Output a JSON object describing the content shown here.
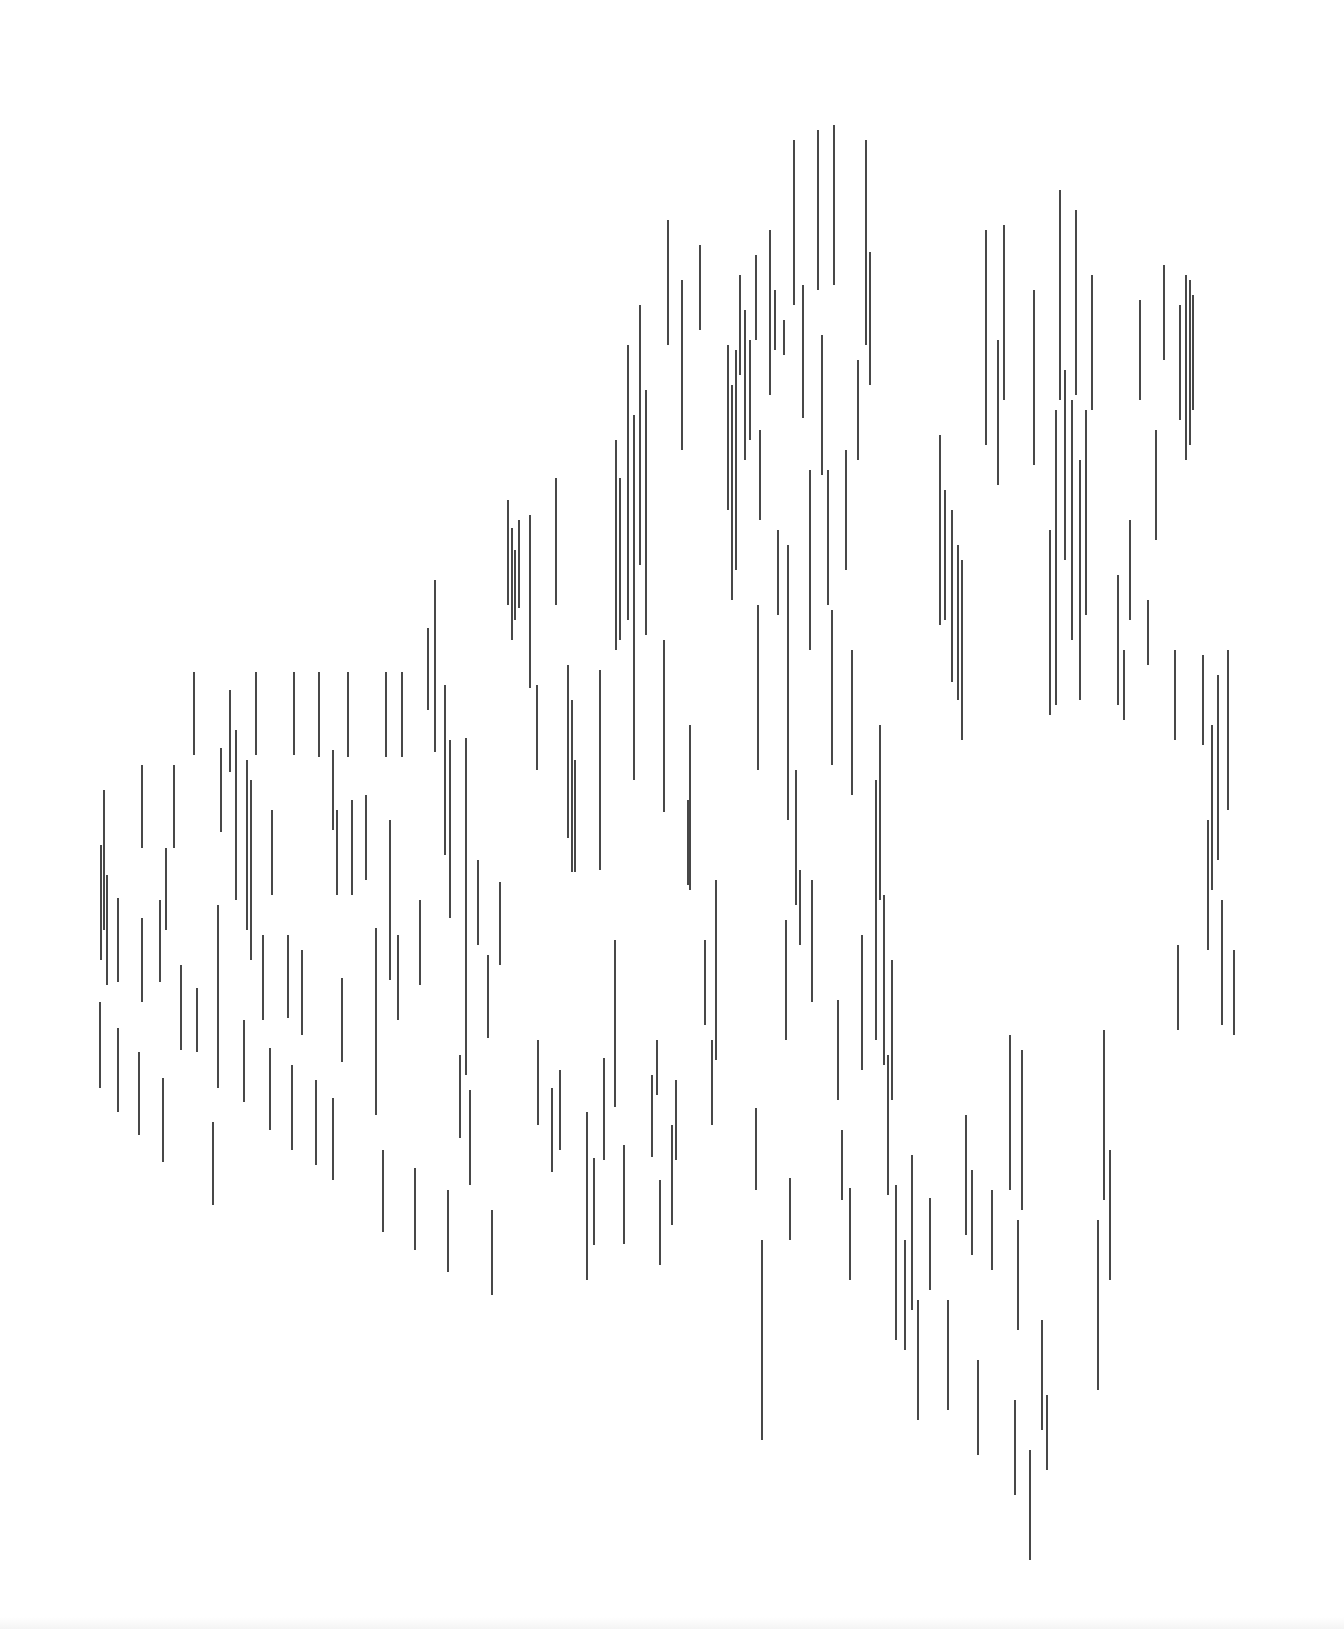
{
  "artwork": {
    "stroke_color": "#1a1a1a",
    "background": "#ffffff",
    "stroke_width": 1.6,
    "lines": [
      [
        104,
        790,
        104,
        930
      ],
      [
        101,
        845,
        101,
        960
      ],
      [
        107,
        875,
        107,
        985
      ],
      [
        100,
        1002,
        100,
        1088
      ],
      [
        118,
        898,
        118,
        982
      ],
      [
        118,
        1028,
        118,
        1112
      ],
      [
        142,
        765,
        142,
        848
      ],
      [
        142,
        918,
        142,
        1002
      ],
      [
        139,
        1052,
        139,
        1135
      ],
      [
        160,
        900,
        160,
        982
      ],
      [
        163,
        1078,
        163,
        1162
      ],
      [
        174,
        765,
        174,
        848
      ],
      [
        166,
        848,
        166,
        930
      ],
      [
        181,
        965,
        181,
        1050
      ],
      [
        194,
        672,
        194,
        755
      ],
      [
        197,
        988,
        197,
        1052
      ],
      [
        213,
        1122,
        213,
        1205
      ],
      [
        221,
        748,
        221,
        832
      ],
      [
        218,
        905,
        218,
        1088
      ],
      [
        230,
        690,
        230,
        772
      ],
      [
        236,
        730,
        236,
        900
      ],
      [
        244,
        1020,
        244,
        1102
      ],
      [
        247,
        760,
        247,
        930
      ],
      [
        256,
        672,
        256,
        755
      ],
      [
        251,
        780,
        251,
        960
      ],
      [
        263,
        935,
        263,
        1020
      ],
      [
        272,
        810,
        272,
        895
      ],
      [
        270,
        1048,
        270,
        1130
      ],
      [
        288,
        935,
        288,
        1018
      ],
      [
        294,
        672,
        294,
        755
      ],
      [
        292,
        1065,
        292,
        1150
      ],
      [
        302,
        950,
        302,
        1035
      ],
      [
        319,
        672,
        319,
        757
      ],
      [
        316,
        1080,
        316,
        1165
      ],
      [
        333,
        750,
        333,
        830
      ],
      [
        333,
        1098,
        333,
        1180
      ],
      [
        337,
        810,
        337,
        895
      ],
      [
        342,
        978,
        342,
        1062
      ],
      [
        348,
        672,
        348,
        757
      ],
      [
        352,
        800,
        352,
        895
      ],
      [
        366,
        795,
        366,
        880
      ],
      [
        376,
        928,
        376,
        1115
      ],
      [
        386,
        672,
        386,
        757
      ],
      [
        383,
        1150,
        383,
        1232
      ],
      [
        390,
        820,
        390,
        980
      ],
      [
        402,
        672,
        402,
        757
      ],
      [
        398,
        935,
        398,
        1020
      ],
      [
        415,
        1168,
        415,
        1250
      ],
      [
        420,
        900,
        420,
        985
      ],
      [
        428,
        628,
        428,
        710
      ],
      [
        435,
        580,
        435,
        752
      ],
      [
        445,
        685,
        445,
        855
      ],
      [
        448,
        1190,
        448,
        1272
      ],
      [
        450,
        740,
        450,
        918
      ],
      [
        460,
        1055,
        460,
        1138
      ],
      [
        466,
        738,
        466,
        1075
      ],
      [
        470,
        1090,
        470,
        1185
      ],
      [
        478,
        860,
        478,
        945
      ],
      [
        488,
        955,
        488,
        1038
      ],
      [
        492,
        1210,
        492,
        1295
      ],
      [
        500,
        882,
        500,
        965
      ],
      [
        508,
        500,
        508,
        605
      ],
      [
        512,
        528,
        512,
        640
      ],
      [
        515,
        550,
        515,
        620
      ],
      [
        519,
        520,
        519,
        608
      ],
      [
        530,
        515,
        530,
        688
      ],
      [
        537,
        685,
        537,
        770
      ],
      [
        538,
        1040,
        538,
        1125
      ],
      [
        552,
        1088,
        552,
        1172
      ],
      [
        556,
        478,
        556,
        605
      ],
      [
        560,
        1070,
        560,
        1150
      ],
      [
        568,
        665,
        568,
        838
      ],
      [
        572,
        700,
        572,
        872
      ],
      [
        575,
        760,
        575,
        872
      ],
      [
        587,
        1112,
        587,
        1280
      ],
      [
        594,
        1158,
        594,
        1245
      ],
      [
        600,
        670,
        600,
        870
      ],
      [
        604,
        1058,
        604,
        1160
      ],
      [
        616,
        440,
        616,
        650
      ],
      [
        615,
        940,
        615,
        1107
      ],
      [
        620,
        478,
        620,
        640
      ],
      [
        624,
        1145,
        624,
        1244
      ],
      [
        628,
        345,
        628,
        620
      ],
      [
        634,
        415,
        634,
        780
      ],
      [
        640,
        305,
        640,
        565
      ],
      [
        646,
        390,
        646,
        635
      ],
      [
        652,
        1075,
        652,
        1157
      ],
      [
        657,
        1040,
        657,
        1095
      ],
      [
        660,
        1180,
        660,
        1265
      ],
      [
        664,
        640,
        664,
        812
      ],
      [
        668,
        220,
        668,
        345
      ],
      [
        672,
        1125,
        672,
        1225
      ],
      [
        676,
        1080,
        676,
        1160
      ],
      [
        682,
        280,
        682,
        450
      ],
      [
        688,
        800,
        688,
        885
      ],
      [
        690,
        725,
        690,
        890
      ],
      [
        700,
        245,
        700,
        330
      ],
      [
        705,
        940,
        705,
        1025
      ],
      [
        712,
        1040,
        712,
        1125
      ],
      [
        716,
        880,
        716,
        1060
      ],
      [
        728,
        345,
        728,
        510
      ],
      [
        732,
        385,
        732,
        600
      ],
      [
        736,
        350,
        736,
        570
      ],
      [
        740,
        275,
        740,
        375
      ],
      [
        745,
        310,
        745,
        460
      ],
      [
        750,
        340,
        750,
        440
      ],
      [
        756,
        255,
        756,
        340
      ],
      [
        758,
        605,
        758,
        770
      ],
      [
        756,
        1108,
        756,
        1190
      ],
      [
        760,
        430,
        760,
        520
      ],
      [
        762,
        1240,
        762,
        1440
      ],
      [
        770,
        230,
        770,
        395
      ],
      [
        775,
        290,
        775,
        350
      ],
      [
        778,
        530,
        778,
        615
      ],
      [
        784,
        320,
        784,
        355
      ],
      [
        788,
        545,
        788,
        820
      ],
      [
        786,
        920,
        786,
        1040
      ],
      [
        794,
        140,
        794,
        305
      ],
      [
        790,
        1178,
        790,
        1240
      ],
      [
        796,
        770,
        796,
        905
      ],
      [
        800,
        870,
        800,
        945
      ],
      [
        803,
        285,
        803,
        418
      ],
      [
        810,
        470,
        810,
        650
      ],
      [
        812,
        880,
        812,
        1002
      ],
      [
        818,
        130,
        818,
        290
      ],
      [
        822,
        335,
        822,
        475
      ],
      [
        828,
        470,
        828,
        605
      ],
      [
        832,
        610,
        832,
        765
      ],
      [
        834,
        125,
        834,
        285
      ],
      [
        838,
        1000,
        838,
        1100
      ],
      [
        842,
        1130,
        842,
        1200
      ],
      [
        846,
        450,
        846,
        570
      ],
      [
        850,
        1188,
        850,
        1280
      ],
      [
        852,
        650,
        852,
        795
      ],
      [
        858,
        360,
        858,
        460
      ],
      [
        862,
        935,
        862,
        1070
      ],
      [
        866,
        140,
        866,
        345
      ],
      [
        870,
        252,
        870,
        385
      ],
      [
        876,
        780,
        876,
        1040
      ],
      [
        880,
        725,
        880,
        900
      ],
      [
        884,
        895,
        884,
        1065
      ],
      [
        888,
        1055,
        888,
        1195
      ],
      [
        892,
        960,
        892,
        1100
      ],
      [
        896,
        1185,
        896,
        1340
      ],
      [
        905,
        1240,
        905,
        1350
      ],
      [
        912,
        1155,
        912,
        1310
      ],
      [
        918,
        1300,
        918,
        1420
      ],
      [
        930,
        1198,
        930,
        1290
      ],
      [
        940,
        435,
        940,
        625
      ],
      [
        945,
        490,
        945,
        620
      ],
      [
        948,
        1300,
        948,
        1410
      ],
      [
        952,
        510,
        952,
        682
      ],
      [
        958,
        545,
        958,
        700
      ],
      [
        962,
        560,
        962,
        740
      ],
      [
        966,
        1115,
        966,
        1235
      ],
      [
        972,
        1170,
        972,
        1255
      ],
      [
        978,
        1360,
        978,
        1455
      ],
      [
        986,
        230,
        986,
        445
      ],
      [
        992,
        1190,
        992,
        1270
      ],
      [
        998,
        340,
        998,
        485
      ],
      [
        1004,
        225,
        1004,
        400
      ],
      [
        1010,
        1035,
        1010,
        1190
      ],
      [
        1018,
        1220,
        1018,
        1330
      ],
      [
        1022,
        1050,
        1022,
        1210
      ],
      [
        1030,
        1450,
        1030,
        1560
      ],
      [
        1034,
        290,
        1034,
        465
      ],
      [
        1042,
        1320,
        1042,
        1430
      ],
      [
        1050,
        530,
        1050,
        715
      ],
      [
        1056,
        410,
        1056,
        705
      ],
      [
        1060,
        190,
        1060,
        400
      ],
      [
        1065,
        370,
        1065,
        560
      ],
      [
        1072,
        400,
        1072,
        640
      ],
      [
        1076,
        210,
        1076,
        395
      ],
      [
        1080,
        460,
        1080,
        700
      ],
      [
        1086,
        410,
        1086,
        615
      ],
      [
        1092,
        275,
        1092,
        410
      ],
      [
        1098,
        1220,
        1098,
        1390
      ],
      [
        1104,
        1030,
        1104,
        1200
      ],
      [
        1110,
        1150,
        1110,
        1280
      ],
      [
        1118,
        575,
        1118,
        705
      ],
      [
        1124,
        650,
        1124,
        720
      ],
      [
        1130,
        520,
        1130,
        620
      ],
      [
        1140,
        300,
        1140,
        400
      ],
      [
        1148,
        600,
        1148,
        665
      ],
      [
        1156,
        430,
        1156,
        540
      ],
      [
        1164,
        265,
        1164,
        360
      ],
      [
        1175,
        650,
        1175,
        740
      ],
      [
        1180,
        305,
        1180,
        420
      ],
      [
        1186,
        275,
        1186,
        460
      ],
      [
        1190,
        280,
        1190,
        445
      ],
      [
        1193,
        295,
        1193,
        410
      ],
      [
        1178,
        945,
        1178,
        1030
      ],
      [
        1203,
        655,
        1203,
        745
      ],
      [
        1208,
        820,
        1208,
        950
      ],
      [
        1212,
        725,
        1212,
        890
      ],
      [
        1218,
        675,
        1218,
        860
      ],
      [
        1222,
        900,
        1222,
        1025
      ],
      [
        1228,
        650,
        1228,
        810
      ],
      [
        1234,
        950,
        1234,
        1035
      ],
      [
        1015,
        1400,
        1015,
        1495
      ],
      [
        1047,
        1395,
        1047,
        1470
      ]
    ]
  }
}
